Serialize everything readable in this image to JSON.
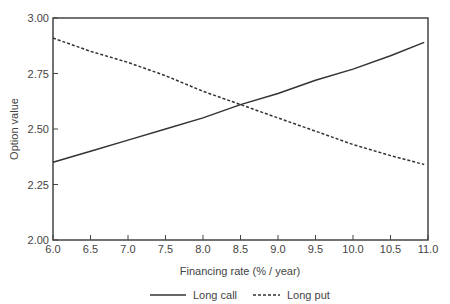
{
  "chart_data": {
    "type": "line",
    "title": "",
    "xlabel": "Financing rate (% / year)",
    "ylabel": "Option value",
    "xlim": [
      6.0,
      11.0
    ],
    "ylim": [
      2.0,
      3.0
    ],
    "x_ticks": [
      "6.0",
      "6.5",
      "7.0",
      "7.5",
      "8.0",
      "8.5",
      "9.0",
      "9.5",
      "10.0",
      "10.5",
      "11.0"
    ],
    "y_ticks": [
      "2.00",
      "2.25",
      "2.50",
      "2.75",
      "3.00"
    ],
    "grid": false,
    "legend_position": "bottom",
    "x": [
      6.0,
      6.5,
      7.0,
      7.5,
      8.0,
      8.5,
      9.0,
      9.5,
      10.0,
      10.5,
      10.95
    ],
    "series": [
      {
        "name": "Long call",
        "style": "solid",
        "values": [
          2.35,
          2.4,
          2.45,
          2.5,
          2.55,
          2.61,
          2.66,
          2.72,
          2.77,
          2.83,
          2.89
        ]
      },
      {
        "name": "Long put",
        "style": "dashed",
        "values": [
          2.91,
          2.85,
          2.8,
          2.74,
          2.67,
          2.61,
          2.55,
          2.49,
          2.43,
          2.38,
          2.34
        ]
      }
    ]
  },
  "legend": {
    "items": [
      {
        "label": "Long call",
        "style": "solid"
      },
      {
        "label": "Long put",
        "style": "dashed"
      }
    ]
  },
  "colors": {
    "axis": "#444444",
    "line": "#333333",
    "background": "#ffffff"
  }
}
